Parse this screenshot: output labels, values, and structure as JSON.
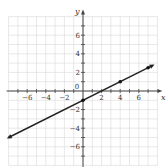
{
  "chart_data": {
    "type": "line",
    "title": "",
    "xlabel": "x",
    "ylabel": "y",
    "xlim": [
      -8,
      8
    ],
    "ylim": [
      -8,
      8
    ],
    "grid": true,
    "x_ticks": [
      -6,
      -4,
      -2,
      0,
      2,
      4,
      6
    ],
    "y_ticks": [
      -6,
      -4,
      -2,
      2,
      4,
      6
    ],
    "x_tick_labels": [
      "−6",
      "−4",
      "−2",
      "0",
      "2",
      "4",
      "6"
    ],
    "y_tick_labels": [
      "−6",
      "−4",
      "−2",
      "2",
      "4",
      "6"
    ],
    "series": [
      {
        "name": "y = 0.5x - 1",
        "slope": 0.5,
        "intercept": -1,
        "x_start": -8,
        "x_end": 7.5,
        "arrows": "both",
        "points": [
          {
            "x": 0,
            "y": -1
          },
          {
            "x": 4,
            "y": 1
          },
          {
            "x": 7,
            "y": 2.5
          }
        ]
      }
    ],
    "legend": null
  },
  "colors": {
    "grid": "#d8d8d8",
    "axis": "#444444",
    "line": "#222222",
    "point": "#111111"
  }
}
